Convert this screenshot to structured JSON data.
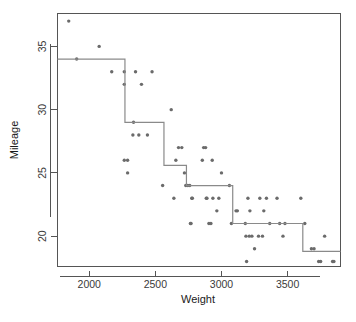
{
  "chart_data": {
    "type": "scatter",
    "title": "",
    "subtitle": "",
    "xlabel": "Weight",
    "ylabel": "Mileage",
    "xlim": [
      1760,
      3900
    ],
    "ylim": [
      17.6,
      37.6
    ],
    "xticks": [
      2000,
      2500,
      3000,
      3500
    ],
    "yticks": [
      20,
      25,
      30,
      35
    ],
    "xtick_labels": [
      "2000",
      "2500",
      "3000",
      "3500"
    ],
    "ytick_labels": [
      "20",
      "25",
      "30",
      "35"
    ],
    "grid": false,
    "legend": "none",
    "point_color": "#6b6b6b",
    "line_color": "#8a8a8a",
    "axis_color": "#555555",
    "background": "#ffffff",
    "series": [
      {
        "name": "observations",
        "type": "scatter",
        "x": [
          1845,
          1905,
          2075,
          2170,
          2265,
          2265,
          2265,
          2290,
          2290,
          2330,
          2335,
          2350,
          2375,
          2395,
          2440,
          2475,
          2555,
          2620,
          2640,
          2655,
          2675,
          2700,
          2720,
          2730,
          2745,
          2760,
          2765,
          2770,
          2775,
          2780,
          2855,
          2865,
          2880,
          2885,
          2890,
          2905,
          2920,
          2930,
          2935,
          2965,
          2980,
          3000,
          3060,
          3075,
          3110,
          3120,
          3180,
          3185,
          3190,
          3200,
          3210,
          3215,
          3230,
          3250,
          3280,
          3290,
          3310,
          3320,
          3340,
          3365,
          3420,
          3440,
          3465,
          3480,
          3600,
          3630,
          3680,
          3700,
          3735,
          3750,
          3780,
          3840,
          3850
        ],
        "y": [
          37,
          34,
          35,
          33,
          33,
          32,
          26,
          26,
          25,
          28,
          29,
          33,
          28,
          32,
          28,
          33,
          24,
          30,
          23,
          26,
          27,
          27,
          25,
          24,
          24,
          24,
          21,
          21,
          23,
          23,
          26,
          27,
          27,
          23,
          23,
          21,
          21,
          26,
          23,
          22,
          23,
          25,
          24,
          21,
          22,
          22,
          21,
          20,
          18,
          23,
          20,
          22,
          20,
          19,
          20,
          23,
          20,
          22,
          23,
          21,
          23,
          21,
          20,
          21,
          23,
          21,
          19,
          19,
          18,
          18,
          20,
          18,
          18
        ]
      },
      {
        "name": "step-fit",
        "type": "step",
        "description": "Piecewise-constant regression-tree fit",
        "breakpoints": [
          1760,
          2270,
          2565,
          2735,
          3085,
          3615,
          3900
        ],
        "levels": [
          34.0,
          29.0,
          25.6,
          24.0,
          21.0,
          18.8
        ]
      }
    ]
  }
}
